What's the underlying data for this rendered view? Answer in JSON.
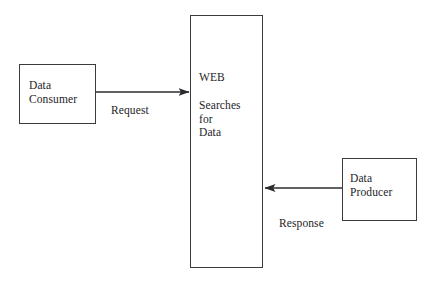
{
  "diagram": {
    "stroke_color": "#3a3a3f",
    "text_color": "#1d1d1f",
    "background_color": "#ffffff",
    "nodes": [
      {
        "id": "consumer",
        "label": "Data\nConsumer",
        "shape": "rectangle"
      },
      {
        "id": "web",
        "title": "WEB",
        "body": "Searches\nfor\nData",
        "shape": "rectangle"
      },
      {
        "id": "producer",
        "label": "Data\nProducer",
        "shape": "rectangle"
      }
    ],
    "edges": [
      {
        "id": "request",
        "label": "Request",
        "from": "consumer",
        "to": "web",
        "direction": "right"
      },
      {
        "id": "response",
        "label": "Response",
        "from": "producer",
        "to": "web",
        "direction": "left"
      }
    ]
  }
}
